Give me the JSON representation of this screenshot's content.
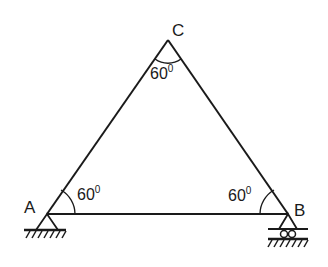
{
  "diagram": {
    "type": "truss",
    "nodes": {
      "A": {
        "label": "A",
        "support": "pin"
      },
      "B": {
        "label": "B",
        "support": "roller"
      },
      "C": {
        "label": "C",
        "support": "none"
      }
    },
    "angles": {
      "A": {
        "value": "60",
        "unit": "0"
      },
      "B": {
        "value": "60",
        "unit": "0"
      },
      "C": {
        "value": "60",
        "unit": "0"
      }
    },
    "colors": {
      "stroke": "#1a1a1a",
      "background": "#ffffff"
    }
  }
}
